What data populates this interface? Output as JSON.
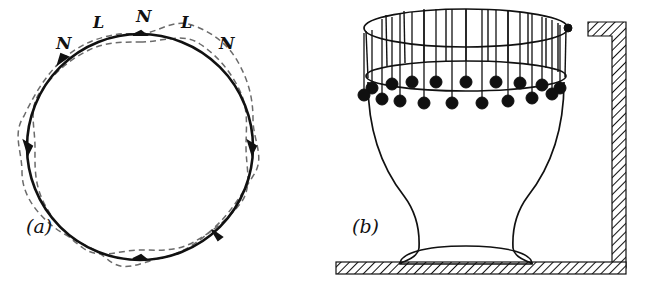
{
  "figure": {
    "background_color": "#ffffff",
    "ink_color": "#111111",
    "dashed_color": "#6b6b6b",
    "bob_color": "#101010",
    "panels": [
      {
        "id": "panel-a",
        "caption": "(a)",
        "caption_x": 26,
        "caption_y": 233,
        "description": "circle with dashed vibration mode curve",
        "circle": {
          "cx": 140,
          "cy": 147,
          "r": 113
        },
        "node_count": 6,
        "labels": [
          {
            "text": "N",
            "x": 56,
            "y": 49,
            "size": 17,
            "role": "node"
          },
          {
            "text": "L",
            "x": 93,
            "y": 28,
            "size": 16,
            "role": "loop"
          },
          {
            "text": "N",
            "x": 136,
            "y": 22,
            "size": 17,
            "role": "node"
          },
          {
            "text": "L",
            "x": 181,
            "y": 28,
            "size": 16,
            "role": "loop"
          },
          {
            "text": "N",
            "x": 219,
            "y": 49,
            "size": 17,
            "role": "node"
          }
        ]
      },
      {
        "id": "panel-b",
        "caption": "(b)",
        "caption_x": 352,
        "caption_y": 233,
        "description": "wine glass with pendulums hanging from hoop, fixed to wall",
        "hoop": {
          "cx": 466,
          "cy": 28,
          "rx": 102,
          "ry": 19
        },
        "rim": {
          "cx": 466,
          "cy": 76,
          "rx": 102,
          "ry": 16
        },
        "vertical_rod_count": 12,
        "pendulum_back_count": 9,
        "pendulum_front_count": 8,
        "bob_radius": 6,
        "wall": {
          "x": 612,
          "y": 22,
          "width": 14,
          "height": 250
        },
        "floor": {
          "x": 336,
          "y": 262,
          "width": 290,
          "height": 12
        }
      }
    ]
  }
}
